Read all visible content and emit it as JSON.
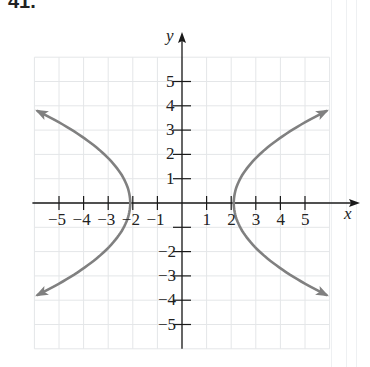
{
  "problem_number": "41.",
  "chart_data": {
    "type": "line",
    "title": "",
    "xlabel": "x",
    "ylabel": "y",
    "xlim": [
      -6,
      6
    ],
    "ylim": [
      -6,
      6
    ],
    "grid": true,
    "x_ticks": [
      -5,
      -4,
      -3,
      -2,
      -1,
      1,
      2,
      3,
      4,
      5
    ],
    "y_ticks": [
      -5,
      -4,
      -3,
      -2,
      -1,
      1,
      2,
      3,
      4,
      5
    ],
    "x_tick_labels": [
      "−5",
      "−4",
      "−3",
      "−2",
      "−1",
      "1",
      "2",
      "3",
      "4",
      "5"
    ],
    "y_tick_labels": [
      "5",
      "4",
      "3",
      "2",
      "1",
      "−2",
      "−3",
      "−4",
      "−5"
    ],
    "series": [
      {
        "name": "right branch",
        "equation": "x = y^2/4 + 2",
        "color": "#808080",
        "points": [
          [
            5.9,
            -3.8
          ],
          [
            5,
            -3.46
          ],
          [
            4,
            -2.83
          ],
          [
            3,
            -2
          ],
          [
            2.5,
            -1.41
          ],
          [
            2,
            0
          ],
          [
            2.5,
            1.41
          ],
          [
            3,
            2
          ],
          [
            4,
            2.83
          ],
          [
            5,
            3.46
          ],
          [
            5.9,
            3.8
          ]
        ],
        "arrows_at_ends": true
      },
      {
        "name": "left branch",
        "equation": "x = -(y^2/4 + 2)",
        "color": "#808080",
        "points": [
          [
            -5.9,
            -3.8
          ],
          [
            -5,
            -3.46
          ],
          [
            -4,
            -2.83
          ],
          [
            -3,
            -2
          ],
          [
            -2.5,
            -1.41
          ],
          [
            -2,
            0
          ],
          [
            -2.5,
            1.41
          ],
          [
            -3,
            2
          ],
          [
            -4,
            2.83
          ],
          [
            -5,
            3.46
          ],
          [
            -5.9,
            3.8
          ]
        ],
        "arrows_at_ends": true
      }
    ]
  },
  "colors": {
    "curve": "#808080",
    "axis": "#1a1a1a",
    "grid": "#e4e6e8"
  }
}
